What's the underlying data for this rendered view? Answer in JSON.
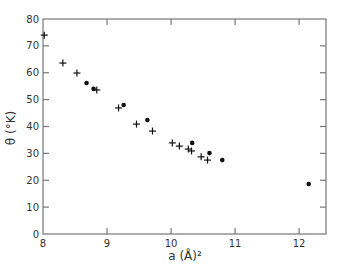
{
  "chart_data": {
    "type": "scatter",
    "title": "",
    "xlabel": "a (Å)²",
    "ylabel": "θ (°K)",
    "xlim": [
      8,
      12.42
    ],
    "ylim": [
      0,
      80
    ],
    "xticks": [
      8,
      9,
      10,
      11,
      12
    ],
    "yticks": [
      0,
      10,
      20,
      30,
      40,
      50,
      60,
      70,
      80
    ],
    "grid": false,
    "legend": null,
    "series": [
      {
        "name": "crosses",
        "marker": "+",
        "points": [
          [
            8.02,
            74.0
          ],
          [
            8.31,
            63.6
          ],
          [
            8.53,
            59.9
          ],
          [
            8.84,
            53.6
          ],
          [
            9.18,
            46.9
          ],
          [
            9.46,
            40.9
          ],
          [
            9.71,
            38.3
          ],
          [
            10.02,
            33.9
          ],
          [
            10.13,
            32.7
          ],
          [
            10.27,
            31.6
          ],
          [
            10.32,
            30.9
          ],
          [
            10.47,
            28.7
          ],
          [
            10.57,
            27.5
          ]
        ]
      },
      {
        "name": "dots",
        "marker": "circle",
        "points": [
          [
            8.68,
            56.2
          ],
          [
            8.79,
            54.0
          ],
          [
            9.26,
            48.0
          ],
          [
            9.63,
            42.4
          ],
          [
            10.33,
            33.9
          ],
          [
            10.6,
            30.1
          ],
          [
            10.8,
            27.5
          ],
          [
            12.15,
            18.6
          ]
        ]
      }
    ]
  },
  "plot_area": {
    "left": 43,
    "right": 326,
    "top": 19,
    "bottom": 234
  },
  "colors": {
    "frame": "#777777",
    "marker": "#111111",
    "text": "#333333"
  }
}
